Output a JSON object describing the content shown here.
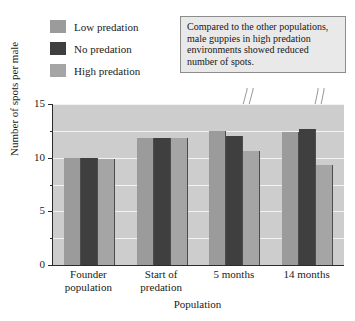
{
  "chart_data": {
    "type": "bar",
    "title": "",
    "xlabel": "Population",
    "ylabel": "Number of spots per male",
    "categories": [
      "Founder population",
      "Start of predation",
      "5 months",
      "14 months"
    ],
    "series": [
      {
        "name": "Low predation",
        "color": "#9b9b9b",
        "values": [
          10.0,
          11.8,
          12.5,
          12.4
        ]
      },
      {
        "name": "No predation",
        "color": "#3f3f3f",
        "values": [
          10.0,
          11.8,
          12.0,
          12.7
        ]
      },
      {
        "name": "High predation",
        "color": "#a5a5a5",
        "values": [
          9.9,
          11.8,
          10.6,
          9.3
        ]
      }
    ],
    "ylim": [
      0,
      15
    ],
    "yticks_major": [
      0,
      5,
      10,
      15
    ],
    "yticks_minor": [
      2.5,
      7.5,
      12.5
    ],
    "grid": true,
    "legend_position": "top-left",
    "annotations": [
      {
        "text": "Compared to the other populations, male guppies in high predation environments showed reduced number of spots.",
        "points_to": [
          "5 months / High predation",
          "14 months / High predation"
        ]
      }
    ],
    "plot_background": "#cdcdcd",
    "gridline_color": "#f2f2f2"
  },
  "legend": {
    "items": [
      {
        "label": "Low predation"
      },
      {
        "label": "No predation"
      },
      {
        "label": "High predation"
      }
    ]
  },
  "callout": {
    "text": "Compared to the other populations, male guppies in high predation environments showed reduced number of spots."
  },
  "axes": {
    "y_label": "Number of spots per male",
    "x_label": "Population",
    "y_ticks": [
      "15",
      "10",
      "5",
      "0"
    ],
    "x_ticks": [
      {
        "line1": "Founder",
        "line2": "population"
      },
      {
        "line1": "Start of",
        "line2": "predation"
      },
      {
        "line1": "5 months",
        "line2": ""
      },
      {
        "line1": "14 months",
        "line2": ""
      }
    ]
  }
}
